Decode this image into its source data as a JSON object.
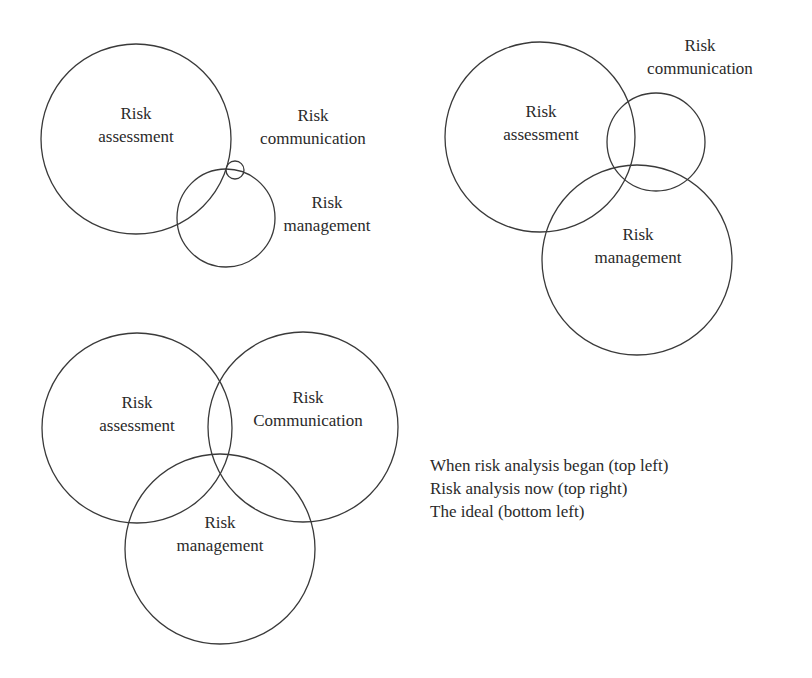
{
  "diagrams": [
    {
      "id": "top-left",
      "caption_ref": "When risk analysis began",
      "circles": [
        {
          "name": "risk-assessment",
          "cx": 136,
          "cy": 139,
          "r": 95,
          "label_line1": "Risk",
          "label_line2": "assessment",
          "lx": 136,
          "ly": 114
        },
        {
          "name": "risk-management",
          "cx": 226,
          "cy": 218,
          "r": 49,
          "label_line1": "Risk",
          "label_line2": "management",
          "lx": 327,
          "ly": 203
        },
        {
          "name": "risk-communication",
          "cx": 235,
          "cy": 170,
          "r": 9,
          "label_line1": "Risk",
          "label_line2": "communication",
          "lx": 313,
          "ly": 116
        }
      ]
    },
    {
      "id": "top-right",
      "caption_ref": "Risk analysis now",
      "circles": [
        {
          "name": "risk-assessment",
          "cx": 540,
          "cy": 137,
          "r": 95,
          "label_line1": "Risk",
          "label_line2": "assessment",
          "lx": 541,
          "ly": 112
        },
        {
          "name": "risk-communication",
          "cx": 656,
          "cy": 142,
          "r": 49,
          "label_line1": "Risk",
          "label_line2": "communication",
          "lx": 700,
          "ly": 46
        },
        {
          "name": "risk-management",
          "cx": 637,
          "cy": 260,
          "r": 95,
          "label_line1": "Risk",
          "label_line2": "management",
          "lx": 638,
          "ly": 235
        }
      ]
    },
    {
      "id": "bottom-left",
      "caption_ref": "The ideal",
      "circles": [
        {
          "name": "risk-assessment",
          "cx": 137,
          "cy": 428,
          "r": 95,
          "label_line1": "Risk",
          "label_line2": "assessment",
          "lx": 137,
          "ly": 403
        },
        {
          "name": "risk-communication",
          "cx": 303,
          "cy": 427,
          "r": 95,
          "label_line1": "Risk",
          "label_line2": "Communication",
          "lx": 308,
          "ly": 398
        },
        {
          "name": "risk-management",
          "cx": 220,
          "cy": 549,
          "r": 95,
          "label_line1": "Risk",
          "label_line2": "management",
          "lx": 220,
          "ly": 523
        }
      ]
    }
  ],
  "legend": {
    "line1": "When risk analysis began (top left)",
    "line2": "Risk analysis now (top right)",
    "line3": "The ideal (bottom left)"
  },
  "style": {
    "stroke_color": "#3a3a3a",
    "text_color": "#2a2a2a",
    "background": "#ffffff"
  }
}
